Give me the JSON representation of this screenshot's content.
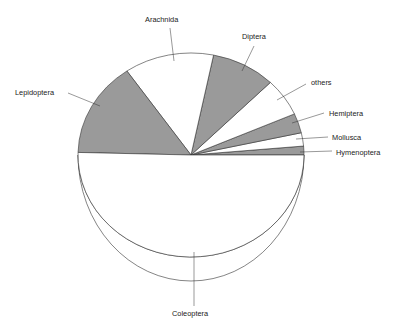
{
  "chart_data": {
    "type": "pie",
    "style": "3d-tilted",
    "title": "",
    "start_angle_deg": 0,
    "direction": "counterclockwise",
    "categories": [
      "Hymenoptera",
      "Mollusca",
      "Hemiptera",
      "others",
      "Diptera",
      "Arachnida",
      "Lepidoptera",
      "Coleoptera"
    ],
    "values": [
      1.4,
      2.1,
      3.1,
      6.0,
      9.2,
      12.8,
      15.0,
      50.4
    ],
    "unit": "percent (estimated from slice angles)",
    "fills": [
      "#9a9a9a",
      "#ffffff",
      "#9a9a9a",
      "#ffffff",
      "#9a9a9a",
      "#ffffff",
      "#9a9a9a",
      "#ffffff"
    ],
    "legend": "none (direct labels with leader lines)",
    "labels": [
      {
        "text": "Hymenoptera",
        "x": 336,
        "y": 155,
        "anchor": "start",
        "line": [
          [
            300,
            152
          ],
          [
            332,
            151
          ]
        ]
      },
      {
        "text": "Mollusca",
        "x": 332,
        "y": 140,
        "anchor": "start",
        "line": [
          [
            296,
            139
          ],
          [
            328,
            137
          ]
        ]
      },
      {
        "text": "Hemiptera",
        "x": 329,
        "y": 116,
        "anchor": "start",
        "line": [
          [
            292,
            123
          ],
          [
            324,
            113
          ]
        ]
      },
      {
        "text": "others",
        "x": 311,
        "y": 85,
        "anchor": "start",
        "line": [
          [
            277,
            100
          ],
          [
            306,
            84
          ]
        ]
      },
      {
        "text": "Diptera",
        "x": 242,
        "y": 39,
        "anchor": "start",
        "line": [
          [
            242,
            71
          ],
          [
            254,
            46
          ]
        ]
      },
      {
        "text": "Arachnida",
        "x": 145,
        "y": 22,
        "anchor": "start",
        "line": [
          [
            174,
            61
          ],
          [
            170,
            28
          ]
        ]
      },
      {
        "text": "Lepidoptera",
        "x": 15,
        "y": 95,
        "anchor": "start",
        "line": [
          [
            68,
            93
          ],
          [
            100,
            106
          ]
        ]
      },
      {
        "text": "Coleoptera",
        "x": 172,
        "y": 316,
        "anchor": "start",
        "line": [
          [
            194,
            252
          ],
          [
            194,
            306
          ]
        ]
      }
    ]
  },
  "colors": {
    "dark_slice": "#9a9a9a",
    "light_slice": "#ffffff",
    "outline": "#333333",
    "text": "#222222"
  }
}
